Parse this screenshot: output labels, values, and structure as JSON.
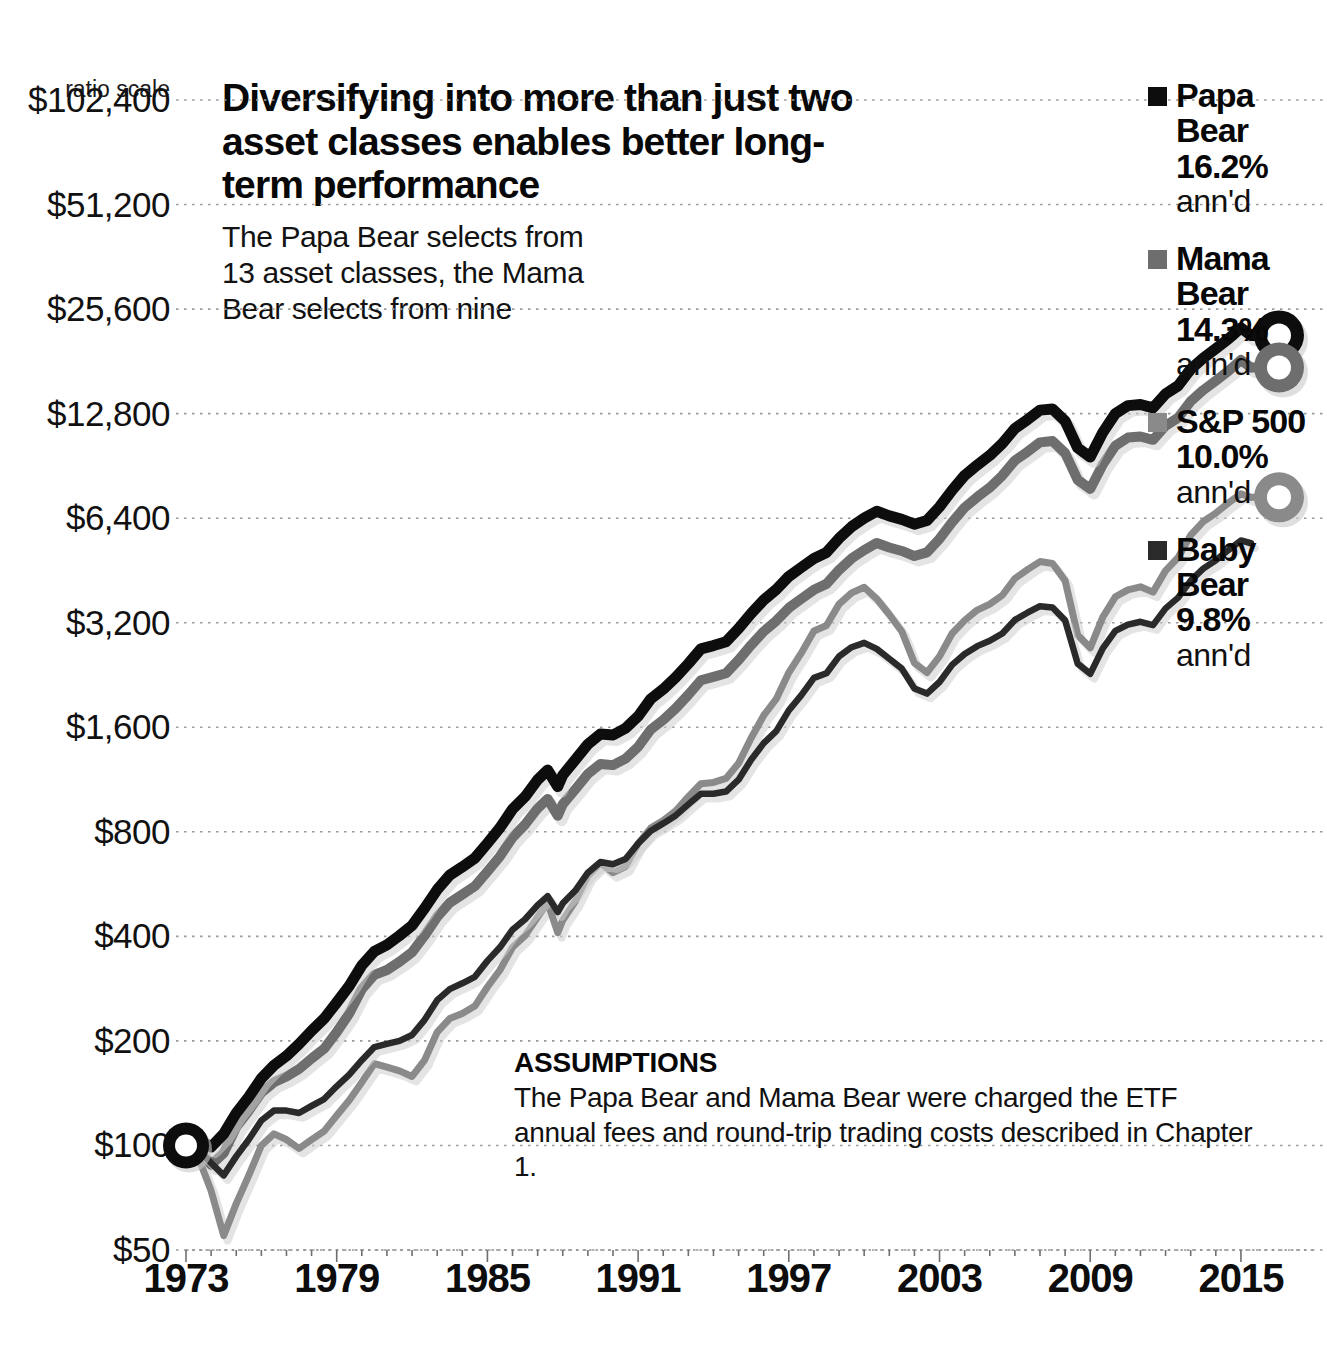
{
  "headline": {
    "title": "Diversifying into more than just two asset classes enables better long-term performance",
    "subtitle": "The Papa Bear selects from 13 asset classes, the Mama Bear selects from nine"
  },
  "assumptions": {
    "title": "ASSUMPTIONS",
    "body": "The Papa Bear and Mama Bear were charged the ETF annual fees and round-trip trading costs described in Chapter 1."
  },
  "axis": {
    "ratio_scale_note": "ratio scale",
    "y_ticks": [
      "$102,400",
      "$51,200",
      "$25,600",
      "$12,800",
      "$6,400",
      "$3,200",
      "$1,600",
      "$800",
      "$400",
      "$200",
      "$100",
      "$50"
    ],
    "x_ticks": [
      "1973",
      "1979",
      "1985",
      "1991",
      "1997",
      "2003",
      "2009",
      "2015"
    ]
  },
  "legend": {
    "entries": [
      {
        "name": "Papa Bear",
        "pct": "16.2%",
        "annd": "ann'd",
        "color": "#0d0d0d",
        "swatch": "legend-swatch-papa-bear"
      },
      {
        "name": "Mama Bear",
        "pct": "14.3%",
        "annd": "ann'd",
        "color": "#6e6e6e",
        "swatch": "legend-swatch-mama-bear"
      },
      {
        "name": "S&P 500",
        "pct": "10.0%",
        "annd": "ann'd",
        "color": "#8a8a8a",
        "swatch": "legend-swatch-sp500"
      },
      {
        "name": "Baby Bear",
        "pct": "9.8%",
        "annd": "ann'd",
        "color": "#2a2a2a",
        "swatch": "legend-swatch-baby-bear"
      }
    ]
  },
  "chart_data": {
    "type": "line",
    "title": "Diversifying into more than just two asset classes enables better long-term performance",
    "subtitle": "The Papa Bear selects from 13 asset classes, the Mama Bear selects from nine",
    "xlabel": "",
    "ylabel": "",
    "yscale": "log2",
    "ylim": [
      50,
      102400
    ],
    "xlim": [
      1973,
      2015.6
    ],
    "grid": true,
    "legend_position": "right",
    "ytick_values": [
      102400,
      51200,
      25600,
      12800,
      6400,
      3200,
      1600,
      800,
      400,
      200,
      100,
      50
    ],
    "xtick_values": [
      1973,
      1979,
      1985,
      1991,
      1997,
      2003,
      2009,
      2015
    ],
    "note": "Growth of $100 invested 1973; annualized returns shown in legend.",
    "x": [
      1973.0,
      1973.5,
      1974.0,
      1974.5,
      1975.0,
      1975.5,
      1976.0,
      1976.5,
      1977.0,
      1977.5,
      1978.0,
      1978.5,
      1979.0,
      1979.5,
      1980.0,
      1980.5,
      1981.0,
      1981.5,
      1982.0,
      1982.5,
      1983.0,
      1983.5,
      1984.0,
      1984.5,
      1985.0,
      1985.5,
      1986.0,
      1986.5,
      1987.0,
      1987.4,
      1987.8,
      1988.0,
      1988.5,
      1989.0,
      1989.5,
      1990.0,
      1990.5,
      1991.0,
      1991.5,
      1992.0,
      1992.5,
      1993.0,
      1993.5,
      1994.0,
      1994.5,
      1995.0,
      1995.5,
      1996.0,
      1996.5,
      1997.0,
      1997.5,
      1998.0,
      1998.5,
      1999.0,
      1999.5,
      2000.0,
      2000.5,
      2001.0,
      2001.5,
      2002.0,
      2002.5,
      2003.0,
      2003.5,
      2004.0,
      2004.5,
      2005.0,
      2005.5,
      2006.0,
      2006.5,
      2007.0,
      2007.5,
      2008.0,
      2008.5,
      2009.0,
      2009.5,
      2010.0,
      2010.5,
      2011.0,
      2011.5,
      2012.0,
      2012.5,
      2013.0,
      2013.5,
      2014.0,
      2014.5,
      2015.0,
      2015.4
    ],
    "series": [
      {
        "name": "Papa Bear",
        "color": "#0d0d0d",
        "annualized": 16.2,
        "values": [
          100,
          104,
          99,
          108,
          124,
          138,
          156,
          170,
          181,
          196,
          214,
          232,
          258,
          288,
          330,
          362,
          378,
          402,
          430,
          482,
          545,
          600,
          634,
          672,
          742,
          822,
          930,
          1010,
          1130,
          1205,
          1080,
          1165,
          1290,
          1430,
          1530,
          1520,
          1590,
          1720,
          1930,
          2060,
          2230,
          2440,
          2690,
          2750,
          2820,
          3080,
          3400,
          3720,
          3990,
          4350,
          4620,
          4900,
          5100,
          5600,
          6050,
          6400,
          6700,
          6500,
          6350,
          6150,
          6300,
          6900,
          7700,
          8500,
          9100,
          9700,
          10500,
          11600,
          12300,
          13100,
          13200,
          12200,
          10200,
          9600,
          11300,
          12800,
          13500,
          13600,
          13300,
          14600,
          15400,
          17200,
          18500,
          19700,
          21000,
          22600,
          21500
        ]
      },
      {
        "name": "Mama Bear",
        "color": "#6e6e6e",
        "annualized": 14.3,
        "values": [
          100,
          98,
          88,
          95,
          113,
          126,
          142,
          152,
          158,
          166,
          178,
          190,
          212,
          240,
          282,
          310,
          320,
          338,
          360,
          402,
          455,
          500,
          528,
          558,
          615,
          680,
          770,
          840,
          935,
          995,
          890,
          960,
          1060,
          1175,
          1255,
          1245,
          1300,
          1405,
          1575,
          1680,
          1815,
          1985,
          2185,
          2235,
          2290,
          2500,
          2760,
          3020,
          3240,
          3530,
          3750,
          3980,
          4140,
          4540,
          4900,
          5180,
          5430,
          5270,
          5150,
          4980,
          5100,
          5580,
          6230,
          6870,
          7360,
          7840,
          8490,
          9380,
          9940,
          10580,
          10670,
          9860,
          8250,
          7770,
          9140,
          10350,
          10920,
          11000,
          10760,
          11810,
          12460,
          13900,
          14960,
          15930,
          16980,
          18270,
          17380
        ]
      },
      {
        "name": "S&P 500",
        "color": "#8a8a8a",
        "annualized": 10.0,
        "values": [
          100,
          92,
          74,
          55,
          68,
          82,
          100,
          108,
          104,
          98,
          104,
          110,
          122,
          135,
          152,
          172,
          168,
          164,
          158,
          176,
          212,
          232,
          240,
          252,
          286,
          320,
          372,
          402,
          455,
          500,
          410,
          445,
          505,
          598,
          650,
          610,
          635,
          740,
          820,
          862,
          920,
          1010,
          1100,
          1110,
          1140,
          1260,
          1490,
          1730,
          1930,
          2300,
          2620,
          3030,
          3140,
          3620,
          3900,
          4050,
          3750,
          3380,
          3020,
          2450,
          2300,
          2560,
          2980,
          3250,
          3480,
          3620,
          3840,
          4290,
          4550,
          4800,
          4740,
          4230,
          2950,
          2710,
          3320,
          3800,
          3980,
          4060,
          3920,
          4520,
          4930,
          5720,
          6260,
          6620,
          7080,
          7520,
          7350
        ]
      },
      {
        "name": "Baby Bear",
        "color": "#2a2a2a",
        "annualized": 9.8,
        "values": [
          100,
          97,
          89,
          82,
          93,
          104,
          118,
          126,
          126,
          124,
          130,
          136,
          148,
          160,
          176,
          192,
          196,
          200,
          208,
          230,
          262,
          282,
          293,
          306,
          340,
          372,
          418,
          448,
          492,
          522,
          470,
          498,
          542,
          610,
          655,
          645,
          668,
          740,
          805,
          846,
          892,
          960,
          1030,
          1030,
          1045,
          1130,
          1290,
          1440,
          1560,
          1790,
          1980,
          2220,
          2290,
          2560,
          2720,
          2800,
          2690,
          2520,
          2360,
          2070,
          2000,
          2160,
          2420,
          2600,
          2740,
          2840,
          2980,
          3260,
          3420,
          3570,
          3540,
          3250,
          2440,
          2280,
          2700,
          3030,
          3160,
          3220,
          3150,
          3520,
          3780,
          4230,
          4580,
          4840,
          5180,
          5520,
          5420
        ]
      }
    ]
  }
}
